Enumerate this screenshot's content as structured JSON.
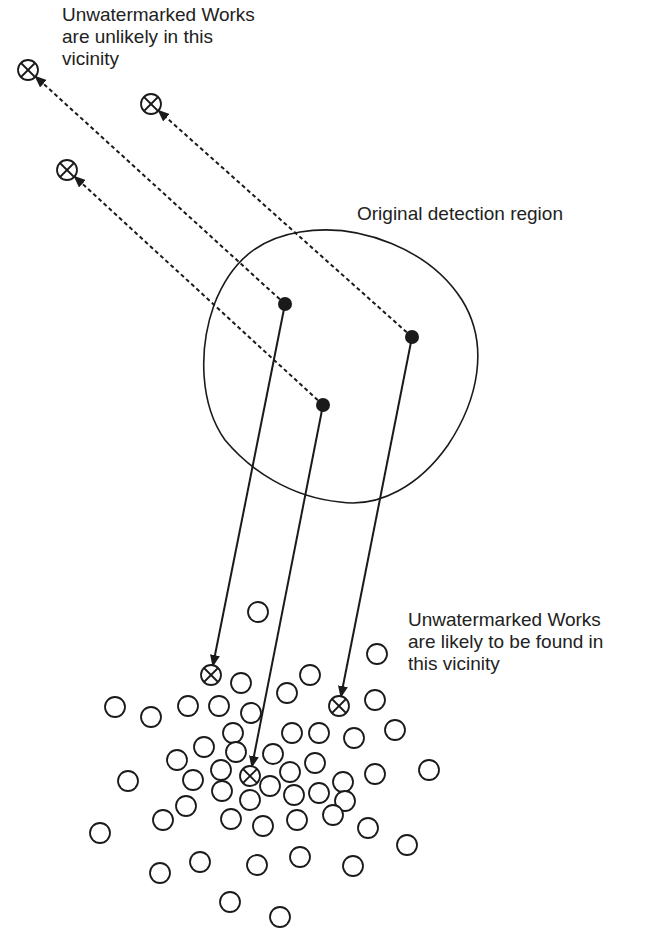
{
  "labels": {
    "top_left": "Unwatermarked Works\nare unlikely in this\nvicinity",
    "region": "Original detection region",
    "bottom_right": "Unwatermarked Works\nare likely to be found in\nthis vicinity"
  },
  "colors": {
    "stroke": "#1a1a1a",
    "text": "#222222",
    "background": "#ffffff"
  },
  "detection_region": {
    "path": "M 300 232 C 360 222, 430 250, 462 300 C 490 345, 478 400, 448 445 C 420 485, 380 508, 340 502 C 290 497, 250 470, 225 440 C 200 405, 198 350, 214 305 C 232 258, 262 238, 300 232 Z"
  },
  "detected_points": [
    {
      "id": "p1",
      "x": 285,
      "y": 304
    },
    {
      "id": "p2",
      "x": 412,
      "y": 337
    },
    {
      "id": "p3",
      "x": 323,
      "y": 405
    }
  ],
  "far_crossed_markers": [
    {
      "x": 28,
      "y": 70
    },
    {
      "x": 151,
      "y": 104
    },
    {
      "x": 67,
      "y": 170
    }
  ],
  "near_crossed_markers": [
    {
      "x": 211,
      "y": 675
    },
    {
      "x": 339,
      "y": 706
    },
    {
      "x": 250,
      "y": 776
    }
  ],
  "dashed_arrows": [
    {
      "from": [
        285,
        304
      ],
      "to": [
        36,
        77
      ]
    },
    {
      "from": [
        412,
        337
      ],
      "to": [
        159,
        111
      ]
    },
    {
      "from": [
        323,
        405
      ],
      "to": [
        75,
        177
      ]
    }
  ],
  "solid_arrows": [
    {
      "from": [
        285,
        304
      ],
      "to": [
        213,
        665
      ]
    },
    {
      "from": [
        412,
        337
      ],
      "to": [
        341,
        696
      ]
    },
    {
      "from": [
        323,
        405
      ],
      "to": [
        252,
        766
      ]
    }
  ],
  "cluster_circles": [
    [
      258,
      612
    ],
    [
      377,
      654
    ],
    [
      241,
      683
    ],
    [
      310,
      675
    ],
    [
      287,
      693
    ],
    [
      375,
      700
    ],
    [
      115,
      707
    ],
    [
      151,
      717
    ],
    [
      188,
      706
    ],
    [
      219,
      706
    ],
    [
      251,
      713
    ],
    [
      233,
      733
    ],
    [
      292,
      733
    ],
    [
      319,
      733
    ],
    [
      354,
      738
    ],
    [
      395,
      730
    ],
    [
      204,
      747
    ],
    [
      236,
      752
    ],
    [
      273,
      754
    ],
    [
      177,
      760
    ],
    [
      221,
      770
    ],
    [
      290,
      772
    ],
    [
      315,
      763
    ],
    [
      128,
      781
    ],
    [
      193,
      780
    ],
    [
      222,
      791
    ],
    [
      270,
      786
    ],
    [
      294,
      795
    ],
    [
      319,
      793
    ],
    [
      343,
      782
    ],
    [
      375,
      774
    ],
    [
      429,
      770
    ],
    [
      250,
      800
    ],
    [
      186,
      806
    ],
    [
      345,
      801
    ],
    [
      163,
      820
    ],
    [
      231,
      819
    ],
    [
      263,
      826
    ],
    [
      297,
      820
    ],
    [
      333,
      815
    ],
    [
      368,
      828
    ],
    [
      100,
      833
    ],
    [
      407,
      845
    ],
    [
      160,
      873
    ],
    [
      200,
      862
    ],
    [
      257,
      865
    ],
    [
      300,
      857
    ],
    [
      353,
      866
    ],
    [
      230,
      902
    ],
    [
      280,
      917
    ]
  ],
  "circle_radius": 10
}
